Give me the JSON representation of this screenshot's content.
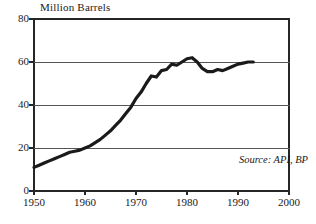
{
  "chart_data": {
    "type": "line",
    "title": "Million Barrels",
    "xlabel": "",
    "ylabel": "Million Barrels",
    "xlim": [
      1950,
      2000
    ],
    "ylim": [
      0,
      80
    ],
    "grid": true,
    "legend": false,
    "annotations": [
      {
        "name": "source-note",
        "text": "Source: API, BP"
      }
    ],
    "yticks": [
      0,
      20,
      40,
      60,
      80
    ],
    "ytick_labels": [
      "0",
      "20",
      "40",
      "60",
      "80"
    ],
    "xticks": [
      1950,
      1960,
      1970,
      1980,
      1990,
      2000
    ],
    "xtick_labels": [
      "1950",
      "1960",
      "1970",
      "1980",
      "1990",
      "2000"
    ],
    "series": [
      {
        "name": "US Petroleum Stocks",
        "color": "#1a1a1a",
        "x": [
          1950,
          1951,
          1952,
          1953,
          1954,
          1955,
          1956,
          1957,
          1958,
          1959,
          1960,
          1961,
          1962,
          1963,
          1964,
          1965,
          1966,
          1967,
          1968,
          1969,
          1970,
          1971,
          1972,
          1973,
          1974,
          1975,
          1976,
          1977,
          1978,
          1979,
          1980,
          1981,
          1982,
          1983,
          1984,
          1985,
          1986,
          1987,
          1988,
          1989,
          1990,
          1991,
          1992,
          1993
        ],
        "values": [
          11,
          12,
          13,
          14,
          15,
          16,
          17,
          18,
          18.5,
          19,
          20,
          21,
          22.5,
          24,
          26,
          28,
          30.5,
          33,
          36,
          39,
          43,
          46,
          50,
          53.5,
          53,
          56,
          56.5,
          59,
          58.5,
          60,
          61.5,
          62,
          60,
          57,
          55.5,
          55.5,
          56.5,
          56,
          57,
          58,
          59,
          59.5,
          60,
          60
        ]
      }
    ]
  }
}
